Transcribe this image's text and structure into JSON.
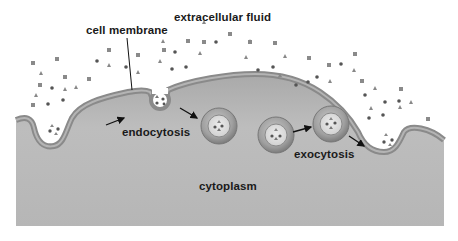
{
  "diagram": {
    "labels": {
      "extracellular": "extracellular fluid",
      "membrane": "cell membrane",
      "endocytosis": "endocytosis",
      "exocytosis": "exocytosis",
      "cytoplasm": "cytoplasm"
    },
    "regions": [
      {
        "name": "extracellular fluid",
        "color": "#ffffff"
      },
      {
        "name": "cytoplasm",
        "color": "#b9b9b9"
      },
      {
        "name": "cell membrane",
        "color": "#8f8f8f"
      }
    ],
    "vesicles": [
      {
        "role": "endocytic vesicle",
        "cx": 219,
        "cy": 126,
        "r": 19
      },
      {
        "role": "transport vesicle",
        "cx": 276,
        "cy": 135,
        "r": 19
      },
      {
        "role": "exocytic vesicle",
        "cx": 331,
        "cy": 127,
        "r": 19
      }
    ],
    "particle_types": [
      "square",
      "circle",
      "triangle"
    ],
    "arrows": [
      {
        "from": "membrane",
        "to": "endocytosis pocket",
        "direction": "right"
      },
      {
        "from": "pinching pocket",
        "to": "endocytic vesicle"
      },
      {
        "from": "transport vesicle",
        "to": "exocytic vesicle"
      },
      {
        "from": "exocytic vesicle",
        "to": "exocytosis pocket"
      }
    ]
  }
}
